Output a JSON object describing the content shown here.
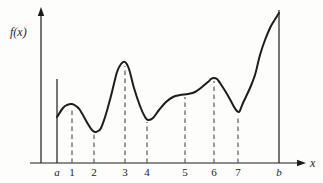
{
  "figure": {
    "y_axis_label": "f(x)",
    "x_axis_label": "x",
    "colors": {
      "background": "#fdfdfc",
      "ink": "#1c1c1c",
      "dash": "#666666"
    },
    "axes": {
      "y_axis_x": 41,
      "axis_y": 163,
      "x_axis_start": 30,
      "x_axis_end": 298,
      "x_arrow_tip": 306,
      "y_axis_top": 14,
      "y_arrow_tip": 7
    },
    "ticks": [
      {
        "label": "a",
        "x": 57,
        "line": "solid",
        "line_top": 79,
        "italic": true
      },
      {
        "label": "1",
        "x": 72,
        "line": "dashed",
        "line_top": 107,
        "italic": false
      },
      {
        "label": "2",
        "x": 94,
        "line": "dashed",
        "line_top": 134,
        "italic": false
      },
      {
        "label": "3",
        "x": 125,
        "line": "dashed",
        "line_top": 66,
        "italic": false
      },
      {
        "label": "4",
        "x": 147,
        "line": "dashed",
        "line_top": 122,
        "italic": false
      },
      {
        "label": "5",
        "x": 185,
        "line": "dashed",
        "line_top": 97,
        "italic": false
      },
      {
        "label": "6",
        "x": 214,
        "line": "dashed",
        "line_top": 81,
        "italic": false
      },
      {
        "label": "7",
        "x": 238,
        "line": "dashed",
        "line_top": 115,
        "italic": false
      },
      {
        "label": "b",
        "x": 279,
        "line": "solid",
        "line_top": 10,
        "italic": true
      }
    ],
    "tick_label_baseline_y": 175.5,
    "curve_points": [
      [
        57,
        117
      ],
      [
        63,
        108
      ],
      [
        67,
        105
      ],
      [
        72,
        104
      ],
      [
        76,
        106
      ],
      [
        80,
        110
      ],
      [
        88,
        124
      ],
      [
        92,
        130
      ],
      [
        95,
        132
      ],
      [
        98,
        131
      ],
      [
        101,
        128
      ],
      [
        106,
        114
      ],
      [
        112,
        92
      ],
      [
        117,
        72
      ],
      [
        121,
        64
      ],
      [
        125,
        62
      ],
      [
        129,
        69
      ],
      [
        134,
        88
      ],
      [
        140,
        106
      ],
      [
        145,
        117
      ],
      [
        148,
        120
      ],
      [
        153,
        118
      ],
      [
        159,
        110
      ],
      [
        166,
        102
      ],
      [
        173,
        97
      ],
      [
        180,
        95
      ],
      [
        188,
        94
      ],
      [
        195,
        92
      ],
      [
        202,
        87
      ],
      [
        208,
        82
      ],
      [
        211,
        79
      ],
      [
        214,
        78
      ],
      [
        217,
        79
      ],
      [
        220,
        83
      ],
      [
        227,
        94
      ],
      [
        233,
        105
      ],
      [
        236,
        110
      ],
      [
        239,
        112
      ],
      [
        241,
        108
      ],
      [
        243,
        103
      ],
      [
        250,
        88
      ],
      [
        255,
        75
      ],
      [
        260,
        55
      ],
      [
        265,
        40
      ],
      [
        270,
        28
      ],
      [
        274,
        21
      ],
      [
        279,
        13
      ]
    ]
  }
}
